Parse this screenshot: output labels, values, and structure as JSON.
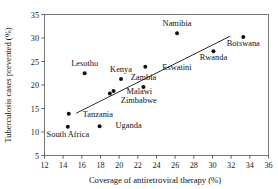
{
  "chart_data": {
    "type": "scatter",
    "title": "",
    "xlabel": "Coverage of antiretroviral therapy (%)",
    "ylabel": "Tuberculosis cases prevented (%)",
    "xlim": [
      12,
      36
    ],
    "ylim": [
      5,
      35
    ],
    "xticks": [
      12,
      14,
      16,
      18,
      20,
      22,
      24,
      26,
      28,
      30,
      32,
      34,
      36
    ],
    "yticks": [
      5,
      10,
      15,
      20,
      25,
      30,
      35
    ],
    "grid": false,
    "legend": "none",
    "points": [
      {
        "label": "Lesotho",
        "x": 16.3,
        "y": 22.5,
        "label_dx": 0,
        "label_dy": -7
      },
      {
        "label": "Kenya",
        "x": 20.2,
        "y": 21.3,
        "label_dx": 0,
        "label_dy": -7
      },
      {
        "label": "Malawi",
        "x": 19.4,
        "y": 18.7,
        "label_dx": 13,
        "label_dy": 3
      },
      {
        "label": "Zimbabwe",
        "x": 19.0,
        "y": 18.2,
        "label_dx": 11,
        "label_dy": 10
      },
      {
        "label": "Tanzania",
        "x": 14.6,
        "y": 13.9,
        "label_dx": 14,
        "label_dy": 3
      },
      {
        "label": "South Africa",
        "x": 14.5,
        "y": 11.1,
        "label_dx": 0,
        "label_dy": 10
      },
      {
        "label": "Uganda",
        "x": 17.9,
        "y": 11.2,
        "label_dx": 16,
        "label_dy": 2
      },
      {
        "label": "Eswatini",
        "x": 22.8,
        "y": 23.9,
        "label_dx": 17,
        "label_dy": 3
      },
      {
        "label": "Zambia",
        "x": 22.6,
        "y": 19.6,
        "label_dx": 0,
        "label_dy": -7
      },
      {
        "label": "Namibia",
        "x": 26.2,
        "y": 31.0,
        "label_dx": 0,
        "label_dy": -7
      },
      {
        "label": "Rwanda",
        "x": 30.1,
        "y": 27.2,
        "label_dx": 0,
        "label_dy": 9
      },
      {
        "label": "Botswana",
        "x": 33.3,
        "y": 30.2,
        "label_dx": 0,
        "label_dy": 9
      }
    ],
    "trendline": {
      "x0": 15.4,
      "y0": 14.0,
      "x1": 31.9,
      "y1": 30.4
    },
    "colors": {
      "point": "#111111",
      "line": "#222222",
      "axis": "#6b6b6b",
      "text": "#121212"
    }
  }
}
